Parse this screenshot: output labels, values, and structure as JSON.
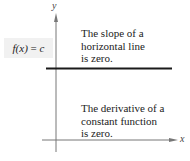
{
  "diagram": {
    "axes": {
      "x_label": "x",
      "y_label": "y"
    },
    "function_label": {
      "lhs": "f(x)",
      "eq": " = ",
      "rhs": "c"
    },
    "notes": {
      "top": [
        "The slope of a",
        "horizontal line",
        "is zero."
      ],
      "bottom": [
        "The derivative of a",
        "constant function",
        "is zero."
      ]
    },
    "colors": {
      "axis": "#777777",
      "line": "#1a1a1a",
      "label_bg": "#f1f1f1"
    }
  }
}
